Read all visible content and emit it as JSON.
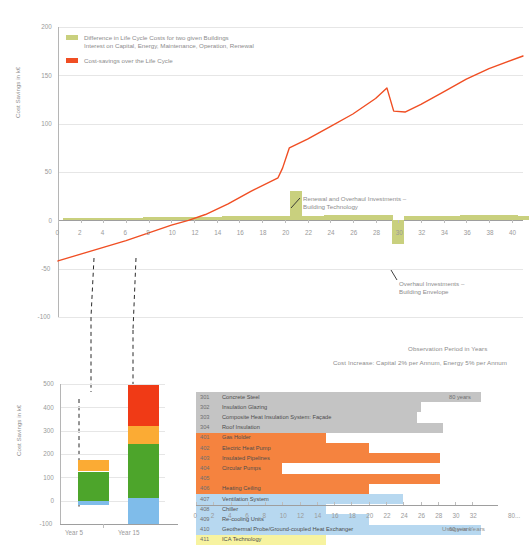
{
  "chart_data": [
    {
      "type": "line",
      "id": "life-cycle-cost-savings",
      "ylabel": "Cost Savings in k€",
      "xlabel": "Observation Period in Years",
      "xlim": [
        0,
        41
      ],
      "ylim": [
        -100,
        200
      ],
      "yticks": [
        200,
        150,
        100,
        50,
        0,
        -50,
        -100
      ],
      "ytick_labels": [
        "200",
        "150",
        "100",
        "50",
        "0",
        "-50",
        "-100"
      ],
      "xticks": [
        0,
        2,
        4,
        6,
        8,
        10,
        12,
        14,
        16,
        18,
        20,
        22,
        24,
        26,
        28,
        30,
        32,
        34,
        36,
        38,
        40
      ],
      "xtick_labels": [
        "0",
        "2",
        "4",
        "6",
        "8",
        "10",
        "12",
        "14",
        "16",
        "18",
        "20",
        "22",
        "24",
        "26",
        "28",
        "30",
        "32",
        "34",
        "36",
        "38",
        "40"
      ],
      "grid": true,
      "legend_position": "top-left",
      "footnote": "Cost Increase: Capital 2% per Annum, Energy 5% per Annum",
      "legend": [
        {
          "color": "#c9d07e",
          "label_line1": "Difference in Life Cycle Costs for two given Buildings",
          "label_line2": "Interest on Capital, Energy, Maintenance, Operation, Renewal"
        },
        {
          "color": "#f04e23",
          "label_line1": "Cost-savings over the Life Cycle",
          "label_line2": ""
        }
      ],
      "series": [
        {
          "name": "Cost-savings over the Life Cycle",
          "color": "#f04e23",
          "type": "line",
          "points": [
            [
              0,
              -42
            ],
            [
              2,
              -35
            ],
            [
              4,
              -28
            ],
            [
              6,
              -21
            ],
            [
              8,
              -13
            ],
            [
              10,
              -5
            ],
            [
              11.5,
              0
            ],
            [
              13,
              6
            ],
            [
              15,
              17
            ],
            [
              17,
              30
            ],
            [
              19.4,
              44
            ],
            [
              19.8,
              54
            ],
            [
              20.4,
              75
            ],
            [
              22,
              84
            ],
            [
              24,
              97
            ],
            [
              26,
              110
            ],
            [
              28,
              126
            ],
            [
              29,
              137
            ],
            [
              29.6,
              113
            ],
            [
              30.6,
              112
            ],
            [
              32,
              120
            ],
            [
              34,
              133
            ],
            [
              36,
              146
            ],
            [
              38,
              157
            ],
            [
              41,
              170
            ]
          ]
        },
        {
          "name": "Difference in Life Cycle Costs for two given Buildings",
          "color": "#c9d07e",
          "type": "bar",
          "categories": [
            1,
            2,
            3,
            4,
            5,
            6,
            7,
            8,
            9,
            10,
            11,
            12,
            13,
            14,
            15,
            16,
            17,
            18,
            19,
            20,
            21,
            22,
            23,
            24,
            25,
            26,
            27,
            28,
            29,
            30,
            31,
            32,
            33,
            34,
            35,
            36,
            37,
            38,
            39,
            40,
            41
          ],
          "values": [
            2.2,
            2.4,
            2.5,
            2.6,
            2.7,
            2.8,
            2.9,
            3.0,
            3.1,
            3.2,
            3.4,
            3.5,
            3.7,
            3.8,
            4.6,
            4.9,
            4.2,
            4.4,
            4.5,
            4.7,
            30,
            4.9,
            5.0,
            5.2,
            5.3,
            5.5,
            5.6,
            5.8,
            6.0,
            -24,
            4.4,
            4.5,
            4.7,
            4.8,
            5.0,
            5.1,
            5.2,
            5.4,
            5.5,
            5.7,
            4.0
          ]
        }
      ],
      "annotations": [
        {
          "text_line1": "Renewal and Overhaul Investments –",
          "text_line2": "Building Technology",
          "target_x": 21,
          "target_y": 30
        },
        {
          "text_line1": "Overhaul Investments –",
          "text_line2": "Building Envelope",
          "target_x": 30,
          "target_y": -24
        }
      ]
    },
    {
      "type": "bar",
      "id": "cost-savings-year-5-15",
      "ylabel": "Cost Savings in k€",
      "ylim": [
        -100,
        500
      ],
      "yticks": [
        500,
        400,
        300,
        200,
        100,
        0,
        -100
      ],
      "ytick_labels": [
        "500",
        "400",
        "300",
        "200",
        "100",
        "0",
        "-100"
      ],
      "grid": true,
      "stacked": true,
      "categories": [
        "Year 5",
        "Year 15"
      ],
      "series": [
        {
          "name": "blue-segment",
          "color": "#7fbcea",
          "values": [
            -20,
            110
          ]
        },
        {
          "name": "green-segment",
          "color": "#4da52b",
          "values": [
            145,
            235
          ]
        },
        {
          "name": "orange-segment",
          "color": "#fbab34",
          "values": [
            48,
            75
          ]
        },
        {
          "name": "red-segment",
          "color": "#f03a16",
          "values": [
            0,
            175
          ]
        }
      ],
      "segment_bounds": {
        "Year 5": [
          [
            -20,
            0
          ],
          [
            0,
            125
          ],
          [
            125,
            173
          ],
          [
            173,
            173
          ]
        ],
        "Year 15": [
          [
            -100,
            10
          ],
          [
            10,
            245
          ],
          [
            245,
            320
          ],
          [
            320,
            495
          ]
        ]
      }
    },
    {
      "type": "bar",
      "id": "usage-in-years",
      "xlabel": "Usage in Years",
      "xlim": [
        0,
        33
      ],
      "xticks": [
        0,
        2,
        4,
        6,
        8,
        10,
        12,
        14,
        16,
        18,
        20,
        22,
        24,
        26,
        28,
        30,
        32
      ],
      "xtick_labels": [
        "0",
        "2",
        "4",
        "6",
        "8",
        "10",
        "12",
        "14",
        "16",
        "18",
        "20",
        "22",
        "24",
        "26",
        "28",
        "30",
        "32"
      ],
      "xtick_extra": "80...",
      "grid": false,
      "rows": [
        {
          "code": "301",
          "name": "Concrete Steel",
          "value": 33,
          "color": "#c4c4c4",
          "note": "80 years"
        },
        {
          "code": "302",
          "name": "Insulation Glazing",
          "value": 26,
          "color": "#c4c4c4",
          "note": ""
        },
        {
          "code": "303",
          "name": "Composite Heat Insulation System: Façade",
          "value": 25.6,
          "color": "#c4c4c4",
          "note": ""
        },
        {
          "code": "304",
          "name": "Roof Insulation",
          "value": 28.6,
          "color": "#c4c4c4",
          "note": ""
        },
        {
          "code": "401",
          "name": "Gas Holder",
          "value": 15,
          "color": "#f5833f",
          "note": ""
        },
        {
          "code": "402",
          "name": "Electric Heat Pump",
          "value": 20,
          "color": "#f5833f",
          "note": ""
        },
        {
          "code": "403",
          "name": "Insulated Pipelines",
          "value": 28.2,
          "color": "#f5833f",
          "note": ""
        },
        {
          "code": "404",
          "name": "Circular Pumps",
          "value": 10,
          "color": "#f5833f",
          "note": ""
        },
        {
          "code": "405",
          "name": "",
          "value": 28.2,
          "color": "#f5833f",
          "note": ""
        },
        {
          "code": "406",
          "name": "Heating Ceiling",
          "value": 20,
          "color": "#f5833f",
          "note": ""
        },
        {
          "code": "407",
          "name": "Ventilation System",
          "value": 24,
          "color": "#b7d8f0",
          "note": ""
        },
        {
          "code": "408",
          "name": "Chiller",
          "value": 15,
          "color": "#b7d8f0",
          "note": ""
        },
        {
          "code": "409",
          "name": "Re-cooling Units",
          "value": 20,
          "color": "#b7d8f0",
          "note": ""
        },
        {
          "code": "410",
          "name": "Geothermal Probe/Ground-coupled Heat Exchanger",
          "value": 33,
          "color": "#b7d8f0",
          "note": "60 years"
        },
        {
          "code": "411",
          "name": "ICA Technology",
          "value": 15,
          "color": "#f7f3a0",
          "note": ""
        }
      ]
    }
  ],
  "connectors": {
    "note": "dashed leader lines from Year 5 and Year 15 of the top chart to the stacked bars below"
  }
}
